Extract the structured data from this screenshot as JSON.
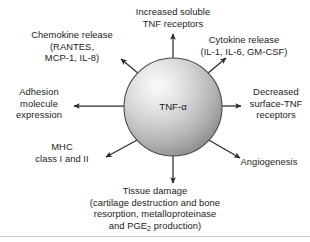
{
  "figure": {
    "center_node": {
      "label": "TNF-α",
      "shape": "sphere"
    },
    "effects": [
      {
        "key": "soluble_receptors",
        "name": "increased-soluble-tnf-receptors",
        "lines": [
          "Increased soluble",
          "TNF receptors"
        ]
      },
      {
        "key": "chemokine",
        "name": "chemokine-release",
        "lines": [
          "Chemokine release",
          "(RANTES,",
          "MCP-1, IL-8)"
        ]
      },
      {
        "key": "cytokine",
        "name": "cytokine-release",
        "lines": [
          "Cytokine release",
          "(IL-1, IL-6, GM-CSF)"
        ]
      },
      {
        "key": "adhesion",
        "name": "adhesion-molecule-expression",
        "lines": [
          "Adhesion",
          "molecule",
          "expression"
        ]
      },
      {
        "key": "surface_receptors",
        "name": "decreased-surface-tnf-receptors",
        "lines": [
          "Decreased",
          "surface-TNF",
          "receptors"
        ]
      },
      {
        "key": "mhc",
        "name": "mhc-class-i-and-ii",
        "lines": [
          "MHC",
          "class I and II"
        ]
      },
      {
        "key": "angiogenesis",
        "name": "angiogenesis",
        "lines": [
          "Angiogenesis"
        ]
      },
      {
        "key": "tissue_damage",
        "name": "tissue-damage",
        "lines": [
          "Tissue damage",
          "(cartilage destruction and bone",
          "resorption, metalloproteinase",
          "and PGE2 production)"
        ],
        "line4_prefix": "and PGE",
        "line4_subscript": "2",
        "line4_suffix": " production)"
      }
    ],
    "colors": {
      "arrow": "#2b2b2b",
      "text": "#1c1c1c",
      "sphere_light": "#f2f2f2",
      "sphere_mid": "#c8c8c8",
      "sphere_dark": "#8f8f8f",
      "sphere_outline": "#4a4a4a",
      "rule": "#c9c9c9",
      "background": "#ffffff"
    }
  }
}
